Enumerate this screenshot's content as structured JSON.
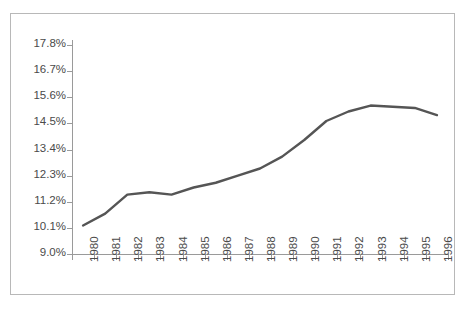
{
  "chart_data": {
    "type": "line",
    "title": "",
    "xlabel": "",
    "ylabel": "",
    "x": [
      1980,
      1981,
      1982,
      1983,
      1984,
      1985,
      1986,
      1987,
      1988,
      1989,
      1990,
      1991,
      1992,
      1993,
      1994,
      1995,
      1996
    ],
    "categories": [
      "1980",
      "1981",
      "1982",
      "1983",
      "1984",
      "1985",
      "1986",
      "1987",
      "1988",
      "1989",
      "1990",
      "1991",
      "1992",
      "1993",
      "1994",
      "1995",
      "1996"
    ],
    "values": [
      10.2,
      10.7,
      11.5,
      11.6,
      11.5,
      11.8,
      12.0,
      12.3,
      12.6,
      13.1,
      13.8,
      14.6,
      15.0,
      15.25,
      15.2,
      15.15,
      14.85
    ],
    "series": [
      {
        "name": "",
        "values": [
          10.2,
          10.7,
          11.5,
          11.6,
          11.5,
          11.8,
          12.0,
          12.3,
          12.6,
          13.1,
          13.8,
          14.6,
          15.0,
          15.25,
          15.2,
          15.15,
          14.85
        ],
        "color": "#555555"
      }
    ],
    "ylim": [
      9.0,
      17.8
    ],
    "ytick_values": [
      9.0,
      10.1,
      11.2,
      12.3,
      13.4,
      14.5,
      15.6,
      16.7,
      17.8
    ],
    "ytick_labels": [
      "9.0%",
      "10.1%",
      "11.2%",
      "12.3%",
      "13.4%",
      "14.5%",
      "15.6%",
      "16.7%",
      "17.8%"
    ],
    "xtick_labels": [
      "1980",
      "1981",
      "1982",
      "1983",
      "1984",
      "1985",
      "1986",
      "1987",
      "1988",
      "1989",
      "1990",
      "1991",
      "1992",
      "1993",
      "1994",
      "1995",
      "1996"
    ],
    "xtick_rotation": -90,
    "grid": false,
    "legend": "none",
    "line_color": "#555555",
    "axis_color": "#9a9a9a",
    "frame_color": "#b8b8b8",
    "label_color": "#4a4a4a",
    "background": "#ffffff"
  }
}
